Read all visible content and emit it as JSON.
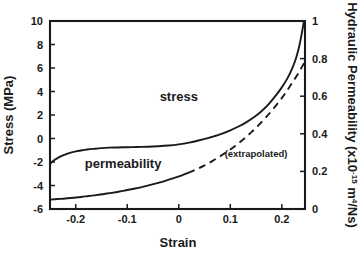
{
  "chart_data": {
    "type": "line",
    "title": "",
    "xlabel": "Strain",
    "ylabel": "Stress (MPa)",
    "y2label_prefix": "Hydraulic Permeability (x10",
    "y2label_exponent": "-15",
    "y2label_suffix_m": " m",
    "y2label_sup4": "4",
    "y2label_tail": "/Ns)",
    "y2label_full": "Hydraulic Permeability (x10-15 m4/Ns)",
    "grid": false,
    "legend_position": "inline-annotations",
    "xlim": [
      -0.25,
      0.245
    ],
    "ylim": [
      -6,
      10
    ],
    "y2lim": [
      0,
      1
    ],
    "xticks": [
      -0.2,
      -0.1,
      0,
      0.1,
      0.2
    ],
    "xticklabels": [
      "-0.2",
      "-0.1",
      "0",
      "0.1",
      "0.2"
    ],
    "yticks": [
      -6,
      -4,
      -2,
      0,
      2,
      4,
      6,
      8,
      10
    ],
    "yticklabels": [
      "-6",
      "-4",
      "-2",
      "0",
      "2",
      "4",
      "6",
      "8",
      "10"
    ],
    "y2ticks": [
      0,
      0.2,
      0.4,
      0.6,
      0.8,
      1
    ],
    "y2ticklabels": [
      "0",
      "0.2",
      "0.4",
      "0.6",
      "0.8",
      "1"
    ],
    "annotations": [
      {
        "text": "stress",
        "x": 0.0,
        "y_axis": "left",
        "y": 3.2
      },
      {
        "text": "permeability",
        "x": -0.108,
        "y_axis": "left",
        "y": -2.5
      },
      {
        "text": "(extrapolated)",
        "x": 0.15,
        "y_axis": "left",
        "y": -1.6
      }
    ],
    "series": [
      {
        "name": "stress",
        "axis": "left",
        "style": "solid",
        "color": "#1a1a1a",
        "x": [
          -0.25,
          -0.245,
          -0.24,
          -0.233,
          -0.226,
          -0.218,
          -0.21,
          -0.2,
          -0.19,
          -0.178,
          -0.165,
          -0.15,
          -0.135,
          -0.12,
          -0.1,
          -0.08,
          -0.06,
          -0.04,
          -0.02,
          0.0,
          0.02,
          0.04,
          0.06,
          0.08,
          0.1,
          0.115,
          0.13,
          0.145,
          0.16,
          0.175,
          0.19,
          0.2,
          0.21,
          0.22,
          0.228,
          0.234,
          0.239,
          0.243
        ],
        "y": [
          -2.2,
          -1.95,
          -1.78,
          -1.6,
          -1.45,
          -1.32,
          -1.2,
          -1.1,
          -1.02,
          -0.94,
          -0.88,
          -0.82,
          -0.78,
          -0.76,
          -0.74,
          -0.72,
          -0.7,
          -0.66,
          -0.6,
          -0.5,
          -0.35,
          -0.15,
          0.08,
          0.35,
          0.7,
          1.0,
          1.35,
          1.78,
          2.3,
          2.95,
          3.75,
          4.35,
          5.05,
          5.95,
          6.9,
          7.9,
          9.0,
          10.0
        ]
      },
      {
        "name": "permeability",
        "axis": "right",
        "style": "solid",
        "color": "#1a1a1a",
        "x": [
          -0.25,
          -0.235,
          -0.22,
          -0.205,
          -0.19,
          -0.175,
          -0.16,
          -0.145,
          -0.13,
          -0.115,
          -0.1,
          -0.085,
          -0.07,
          -0.055,
          -0.04,
          -0.025,
          -0.01,
          0.005,
          0.018
        ],
        "y": [
          0.05,
          0.053,
          0.056,
          0.06,
          0.064,
          0.069,
          0.074,
          0.08,
          0.086,
          0.093,
          0.101,
          0.109,
          0.118,
          0.128,
          0.139,
          0.151,
          0.164,
          0.178,
          0.192
        ]
      },
      {
        "name": "permeability (extrapolated)",
        "axis": "right",
        "style": "dashed",
        "color": "#1a1a1a",
        "x": [
          0.018,
          0.035,
          0.05,
          0.065,
          0.08,
          0.095,
          0.11,
          0.125,
          0.14,
          0.155,
          0.17,
          0.185,
          0.2,
          0.212,
          0.224,
          0.234,
          0.243
        ],
        "y": [
          0.192,
          0.212,
          0.232,
          0.255,
          0.28,
          0.307,
          0.337,
          0.37,
          0.406,
          0.446,
          0.49,
          0.538,
          0.59,
          0.637,
          0.687,
          0.731,
          0.775
        ]
      }
    ]
  },
  "plot_area": {
    "left": 50,
    "right": 305,
    "top": 21,
    "bottom": 209
  },
  "colors": {
    "ink": "#1a1a1a",
    "background": "#ffffff"
  }
}
